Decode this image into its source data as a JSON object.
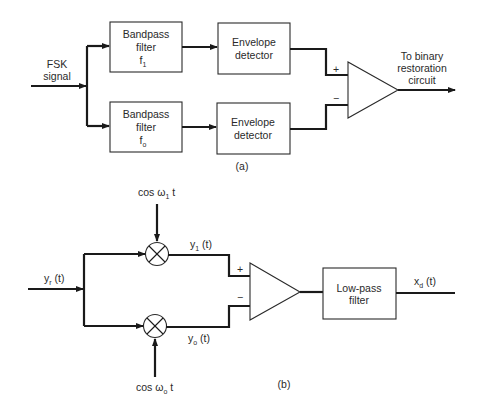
{
  "figure_a": {
    "input_label_line1": "FSK",
    "input_label_line2": "signal",
    "bandpass_upper": {
      "line1": "Bandpass",
      "line2": "filter",
      "freq": "f",
      "freq_sub": "1"
    },
    "bandpass_lower": {
      "line1": "Bandpass",
      "line2": "filter",
      "freq": "f",
      "freq_sub": "o"
    },
    "envelope_upper": {
      "line1": "Envelope",
      "line2": "detector"
    },
    "envelope_lower": {
      "line1": "Envelope",
      "line2": "detector"
    },
    "comparator_plus": "+",
    "comparator_minus": "−",
    "output_label_line1": "To binary",
    "output_label_line2": "restoration",
    "output_label_line3": "circuit",
    "caption": "(a)"
  },
  "figure_b": {
    "input_label": "y",
    "input_label_sub": "r",
    "input_label_suffix": " (t)",
    "osc_upper_prefix": "cos ω",
    "osc_upper_sub": "1",
    "osc_upper_suffix": " t",
    "osc_lower_prefix": "cos ω",
    "osc_lower_sub": "o",
    "osc_lower_suffix": " t",
    "mixer_upper_out": "y",
    "mixer_upper_out_sub": "1",
    "mixer_upper_out_suffix": " (t)",
    "mixer_lower_out": "y",
    "mixer_lower_out_sub": "o",
    "mixer_lower_out_suffix": " (t)",
    "comparator_plus": "+",
    "comparator_minus": "−",
    "lowpass": {
      "line1": "Low-pass",
      "line2": "filter"
    },
    "output_label": "x",
    "output_label_sub": "d",
    "output_label_suffix": " (t)",
    "caption": "(b)"
  }
}
